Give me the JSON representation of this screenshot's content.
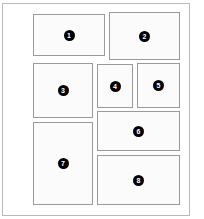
{
  "diagram": {
    "type": "layout-grid",
    "canvas": {
      "width": 204,
      "height": 219,
      "background": "#ffffff"
    },
    "frame": {
      "label": "page-frame",
      "x": 2,
      "y": 3,
      "width": 188,
      "height": 213,
      "border_color": "#b9b9b9"
    },
    "style": {
      "cell_border_color": "#9a9a9a",
      "cell_fill": "#fbfbfb",
      "badge_fill": "#000000",
      "badge_text_color": "#ffffff"
    },
    "cells": [
      {
        "number": "1",
        "x": 33,
        "y": 14,
        "width": 72,
        "height": 42
      },
      {
        "number": "2",
        "x": 109,
        "y": 12,
        "width": 71,
        "height": 48
      },
      {
        "number": "3",
        "x": 33,
        "y": 63,
        "width": 60,
        "height": 55
      },
      {
        "number": "4",
        "x": 97,
        "y": 64,
        "width": 36,
        "height": 44
      },
      {
        "number": "5",
        "x": 137,
        "y": 63,
        "width": 43,
        "height": 45
      },
      {
        "number": "6",
        "x": 97,
        "y": 111,
        "width": 83,
        "height": 40
      },
      {
        "number": "7",
        "x": 33,
        "y": 122,
        "width": 60,
        "height": 83
      },
      {
        "number": "8",
        "x": 97,
        "y": 155,
        "width": 83,
        "height": 50
      }
    ]
  }
}
